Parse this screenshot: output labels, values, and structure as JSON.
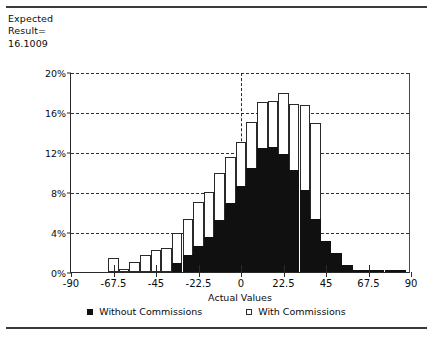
{
  "annotation": {
    "text": "Expected\nResult=\n  16.1009"
  },
  "legend": {
    "items": [
      {
        "label": "Without Commissions",
        "style": "filled"
      },
      {
        "label": "With Commissions",
        "style": "open"
      }
    ]
  },
  "chart_data": {
    "type": "bar",
    "title": "",
    "subtitle": "",
    "xlabel": "Actual Values",
    "ylabel": "",
    "xlim": [
      -90,
      90
    ],
    "ylim": [
      0,
      20
    ],
    "grid": true,
    "legend_position": "bottom",
    "ytick_labels": [
      "0%",
      "4%",
      "8%",
      "12%",
      "16%",
      "20%"
    ],
    "ytick_values": [
      0,
      4,
      8,
      12,
      16,
      20
    ],
    "xtick_labels": [
      "-90",
      "-67.5",
      "-45",
      "-22.5",
      "0",
      "22.5",
      "45",
      "67.5",
      "90"
    ],
    "xtick_values": [
      -90,
      -67.5,
      -45,
      -22.5,
      0,
      22.5,
      45,
      67.5,
      90
    ],
    "bin_width": 5.625,
    "bin_centers": [
      -84.4,
      -78.8,
      -73.1,
      -67.5,
      -61.9,
      -56.3,
      -50.6,
      -45.0,
      -39.4,
      -33.8,
      -28.1,
      -22.5,
      -16.9,
      -11.3,
      -5.6,
      0.0,
      5.6,
      11.3,
      16.9,
      22.5,
      28.1,
      33.8,
      39.4,
      45.0,
      50.6,
      56.3,
      61.9,
      67.5,
      73.1,
      78.8,
      84.4
    ],
    "series": [
      {
        "name": "With Commissions",
        "style": "open",
        "values": [
          0,
          0,
          0,
          1.4,
          0.3,
          1.0,
          1.7,
          2.2,
          2.4,
          3.9,
          5.3,
          7.0,
          8.0,
          9.9,
          11.5,
          13.0,
          15.0,
          17.0,
          17.1,
          17.9,
          16.8,
          16.7,
          14.9,
          0,
          0,
          0,
          0,
          0,
          0,
          0,
          0
        ]
      },
      {
        "name": "Without Commissions",
        "style": "filled",
        "values": [
          0,
          0,
          0,
          0,
          0,
          0,
          0,
          0,
          0,
          0.9,
          1.7,
          2.6,
          3.5,
          5.2,
          6.9,
          8.6,
          10.4,
          12.4,
          12.5,
          11.8,
          10.2,
          8.2,
          5.3,
          3.1,
          1.9,
          0.7,
          0.25,
          0.2,
          0.18,
          0.15,
          0.12
        ]
      }
    ]
  }
}
